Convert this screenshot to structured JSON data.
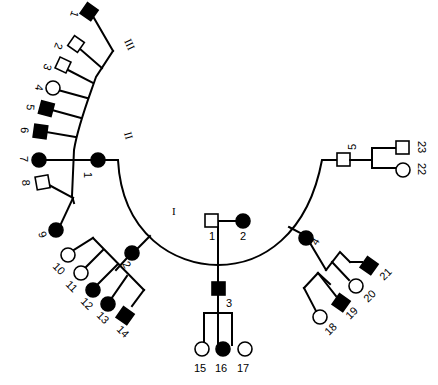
{
  "diagram": {
    "type": "pedigree",
    "colors": {
      "affected": "#000000",
      "unaffected": "#ffffff",
      "line": "#000000"
    },
    "generations": [
      "I",
      "II",
      "III"
    ],
    "individuals": {
      "I-1": {
        "label": "1",
        "sex": "male",
        "affected": false
      },
      "I-2": {
        "label": "2",
        "sex": "female",
        "affected": true
      },
      "II-1": {
        "label": "1",
        "sex": "female",
        "affected": true
      },
      "II-2": {
        "label": "2",
        "sex": "female",
        "affected": true
      },
      "II-3": {
        "label": "3",
        "sex": "male",
        "affected": true
      },
      "II-4": {
        "label": "4",
        "sex": "female",
        "affected": true
      },
      "II-5": {
        "label": "5",
        "sex": "male",
        "affected": false
      },
      "III-1": {
        "label": "1",
        "sex": "male",
        "affected": true
      },
      "III-2": {
        "label": "2",
        "sex": "male",
        "affected": false
      },
      "III-3": {
        "label": "3",
        "sex": "male",
        "affected": false
      },
      "III-4": {
        "label": "4",
        "sex": "female",
        "affected": false
      },
      "III-5": {
        "label": "5",
        "sex": "male",
        "affected": true
      },
      "III-6": {
        "label": "6",
        "sex": "male",
        "affected": true
      },
      "III-7": {
        "label": "7",
        "sex": "female",
        "affected": true
      },
      "III-8": {
        "label": "8",
        "sex": "male",
        "affected": false
      },
      "III-9": {
        "label": "9",
        "sex": "female",
        "affected": true
      },
      "III-10": {
        "label": "10",
        "sex": "female",
        "affected": false
      },
      "III-11": {
        "label": "11",
        "sex": "female",
        "affected": false
      },
      "III-12": {
        "label": "12",
        "sex": "female",
        "affected": true
      },
      "III-13": {
        "label": "13",
        "sex": "female",
        "affected": true
      },
      "III-14": {
        "label": "14",
        "sex": "male",
        "affected": true
      },
      "III-15": {
        "label": "15",
        "sex": "female",
        "affected": false
      },
      "III-16": {
        "label": "16",
        "sex": "female",
        "affected": true
      },
      "III-17": {
        "label": "17",
        "sex": "female",
        "affected": false
      },
      "III-18": {
        "label": "18",
        "sex": "female",
        "affected": false
      },
      "III-19": {
        "label": "19",
        "sex": "male",
        "affected": true
      },
      "III-20": {
        "label": "20",
        "sex": "female",
        "affected": false
      },
      "III-21": {
        "label": "21",
        "sex": "male",
        "affected": true
      },
      "III-22": {
        "label": "22",
        "sex": "female",
        "affected": false
      },
      "III-23": {
        "label": "23",
        "sex": "male",
        "affected": false
      }
    },
    "families": [
      {
        "parents": [
          "I-1",
          "I-2"
        ],
        "children": [
          "II-1",
          "II-2",
          "II-3",
          "II-4",
          "II-5"
        ]
      },
      {
        "parent": "II-1",
        "children": [
          "III-1",
          "III-2",
          "III-3",
          "III-4",
          "III-5",
          "III-6",
          "III-7",
          "III-8",
          "III-9"
        ]
      },
      {
        "parent": "II-2",
        "children": [
          "III-10",
          "III-11",
          "III-12",
          "III-13",
          "III-14"
        ]
      },
      {
        "parent": "II-3",
        "children": [
          "III-15",
          "III-16",
          "III-17"
        ]
      },
      {
        "parent": "II-4",
        "children": [
          "III-18",
          "III-19",
          "III-20",
          "III-21"
        ]
      },
      {
        "parent": "II-5",
        "children": [
          "III-22",
          "III-23"
        ]
      }
    ]
  }
}
